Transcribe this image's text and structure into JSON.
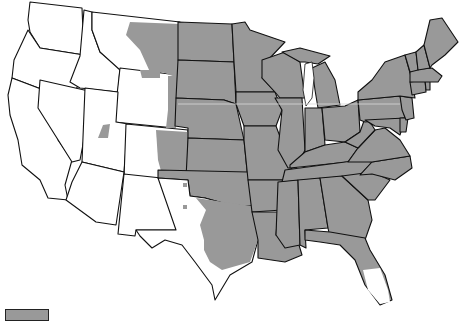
{
  "map": {
    "title": "",
    "colors": {
      "range_fill": "#999999",
      "outside_fill": "#ffffff",
      "border": "#111111"
    },
    "legend": {
      "items": [
        {
          "label": "",
          "color": "#999999"
        }
      ]
    },
    "states_in_range": [
      "ND",
      "SD",
      "NE",
      "KS",
      "OK",
      "MN",
      "IA",
      "MO",
      "AR",
      "LA",
      "WI",
      "IL",
      "MI",
      "IN",
      "OH",
      "KY",
      "TN",
      "MS",
      "AL",
      "GA",
      "FL",
      "SC",
      "NC",
      "VA",
      "WV",
      "MD",
      "DE",
      "PA",
      "NJ",
      "NY",
      "CT",
      "RI",
      "MA",
      "VT",
      "NH",
      "ME"
    ],
    "states_partial": [
      "MT",
      "WY",
      "CO",
      "TX",
      "NM",
      "UT",
      "FL"
    ],
    "states_outside": [
      "WA",
      "OR",
      "CA",
      "NV",
      "ID",
      "AZ"
    ]
  }
}
